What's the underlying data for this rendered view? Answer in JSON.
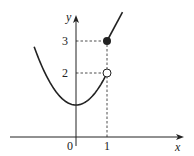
{
  "chart_data": {
    "type": "line",
    "title": "",
    "xlabel": "x",
    "ylabel": "y",
    "x_ticks": [
      {
        "value": 0,
        "label": "0"
      },
      {
        "value": 1,
        "label": "1"
      }
    ],
    "y_ticks": [
      {
        "value": 2,
        "label": "2"
      },
      {
        "value": 3,
        "label": "3"
      }
    ],
    "xlim": [
      -2.4,
      2.7
    ],
    "ylim": [
      -0.5,
      4.0
    ],
    "series": [
      {
        "name": "parabola-piece",
        "description": "f(x) = x^2 + 1 for x < 1",
        "domain": [
          -1.35,
          1
        ],
        "points": [
          [
            -1.35,
            3.3
          ],
          [
            -1,
            2
          ],
          [
            -0.5,
            1.25
          ],
          [
            0,
            1
          ],
          [
            0.5,
            1.25
          ],
          [
            1,
            2
          ]
        ],
        "end_marker": {
          "x": 1,
          "y": 2,
          "type": "open"
        }
      },
      {
        "name": "line-piece",
        "description": "line starting at (1,3) for x >= 1",
        "domain": [
          1,
          1.5
        ],
        "points": [
          [
            1,
            3
          ],
          [
            1.5,
            3.9
          ]
        ],
        "start_marker": {
          "x": 1,
          "y": 3,
          "type": "closed"
        }
      }
    ],
    "guides": [
      {
        "from": [
          0,
          3
        ],
        "to": [
          1,
          3
        ]
      },
      {
        "from": [
          0,
          2
        ],
        "to": [
          1,
          2
        ]
      },
      {
        "from": [
          1,
          0
        ],
        "to": [
          1,
          3
        ]
      }
    ],
    "grid": false,
    "legend": "none"
  },
  "colors": {
    "ink": "#222222",
    "background": "#ffffff"
  }
}
